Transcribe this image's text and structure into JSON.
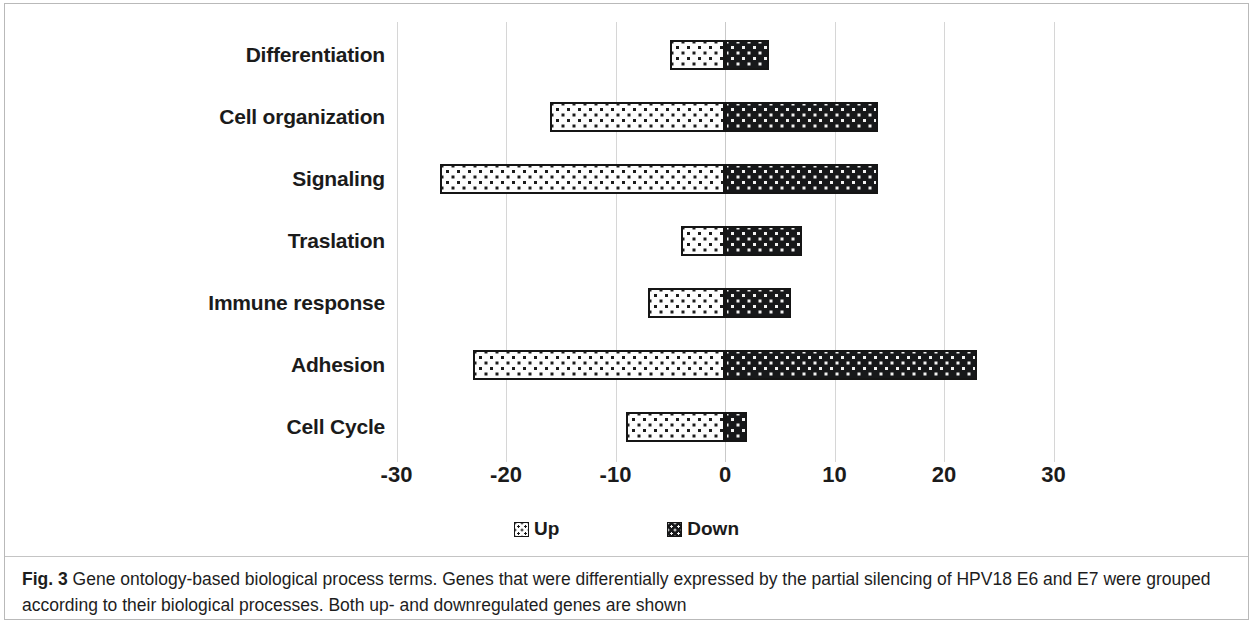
{
  "figure": {
    "label": "Fig. 3",
    "caption": " Gene ontology-based biological process terms. Genes that were differentially expressed by the partial silencing of HPV18 E6 and E7 were grouped according to their biological processes. Both up- and downregulated genes are shown"
  },
  "legend": {
    "position": "bottom-center",
    "items": [
      {
        "label": "Up",
        "swatch": "light-dotted-swatch-icon"
      },
      {
        "label": "Down",
        "swatch": "dark-dotted-swatch-icon"
      }
    ]
  },
  "axis": {
    "ticks": [
      "-30",
      "-20",
      "-10",
      "0",
      "10",
      "20",
      "30"
    ],
    "tick_values": [
      -30,
      -20,
      -10,
      0,
      10,
      20,
      30
    ]
  },
  "colors": {
    "up_fill": "#fdfdfd",
    "up_dot": "#1b1b1b",
    "down_fill": "#17181a",
    "down_dot": "#f2f2f2",
    "bar_border": "#151515",
    "gridline": "#d6d6d6",
    "text": "#1b1b1b",
    "background": "#ffffff"
  },
  "chart_data": {
    "type": "bar",
    "orientation": "horizontal",
    "stacked": "diverging",
    "title": "",
    "xlabel": "",
    "ylabel": "",
    "xlim": [
      -35,
      35
    ],
    "xticks": [
      -30,
      -20,
      -10,
      0,
      10,
      20,
      30
    ],
    "grid": true,
    "legend": [
      "Up",
      "Down"
    ],
    "legend_position": "bottom-center",
    "categories": [
      "Differentiation",
      "Cell organization",
      "Signaling",
      "Traslation",
      "Immune response",
      "Adhesion",
      "Cell Cycle"
    ],
    "series": [
      {
        "name": "Up",
        "note": "plotted as negative values (left of zero)",
        "values": [
          -5,
          -16,
          -26,
          -4,
          -7,
          -23,
          -9
        ]
      },
      {
        "name": "Down",
        "note": "plotted as positive values (right of zero)",
        "values": [
          4,
          14,
          14,
          7,
          6,
          23,
          2
        ]
      }
    ]
  }
}
